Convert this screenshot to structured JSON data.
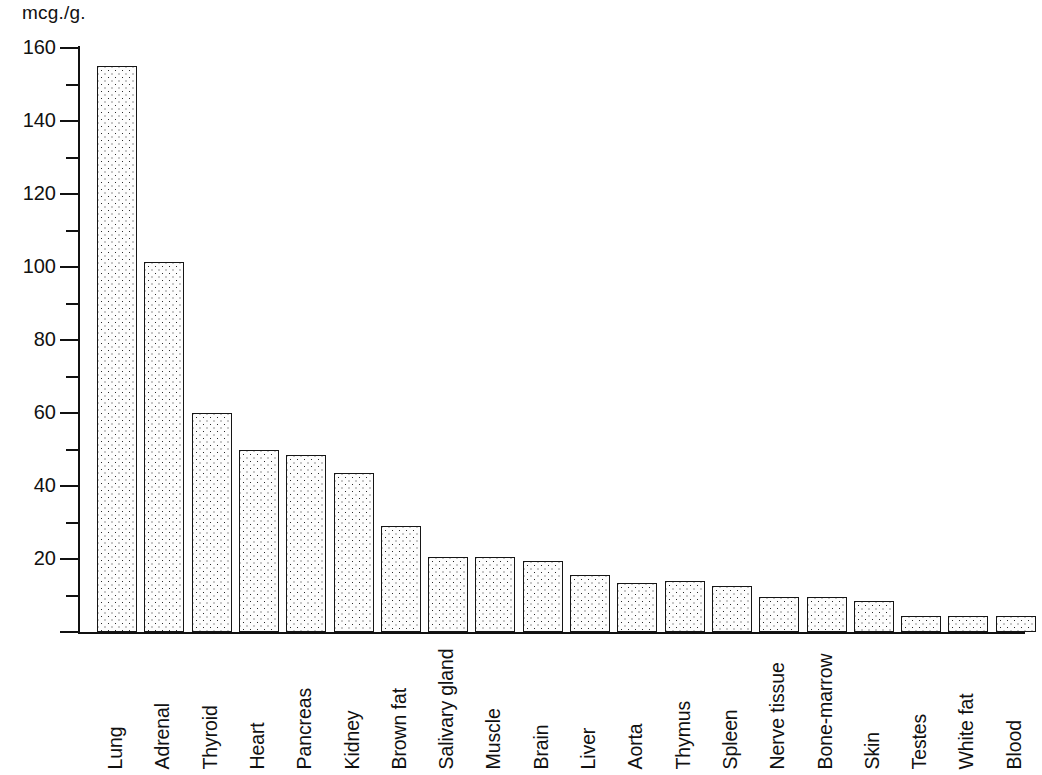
{
  "chart_data": {
    "type": "bar",
    "title": "",
    "subtitle": "",
    "xlabel": "",
    "ylabel": "mcg./g.",
    "ylim": [
      0,
      160
    ],
    "y_major_ticks": [
      0,
      20,
      40,
      60,
      80,
      100,
      120,
      140,
      160
    ],
    "y_major_tick_labels": [
      "",
      "20",
      "40",
      "60",
      "80",
      "100",
      "120",
      "140",
      "160"
    ],
    "y_minor_ticks": [
      10,
      30,
      50,
      70,
      90,
      110,
      130,
      150
    ],
    "grid": false,
    "legend": null,
    "orientation": "vertical",
    "bar_fill": "stippled-dots",
    "categories": [
      "Lung",
      "Adrenal",
      "Thyroid",
      "Heart",
      "Pancreas",
      "Kidney",
      "Brown fat",
      "Salivary gland",
      "Muscle",
      "Brain",
      "Liver",
      "Aorta",
      "Thymus",
      "Spleen",
      "Nerve tissue",
      "Bone-marrow",
      "Skin",
      "Testes",
      "White fat",
      "Blood"
    ],
    "values": [
      155.0,
      101.5,
      60.0,
      50.0,
      48.5,
      43.5,
      29.0,
      20.5,
      20.5,
      19.5,
      15.5,
      13.5,
      14.0,
      12.5,
      9.5,
      9.5,
      8.5,
      4.5,
      4.5,
      4.5
    ]
  },
  "axis": {
    "unit_label": "mcg./g."
  },
  "colors": {
    "ink": "#111111",
    "bar_border": "#161616",
    "bar_face": "#fdfdfd",
    "background": "#ffffff"
  }
}
